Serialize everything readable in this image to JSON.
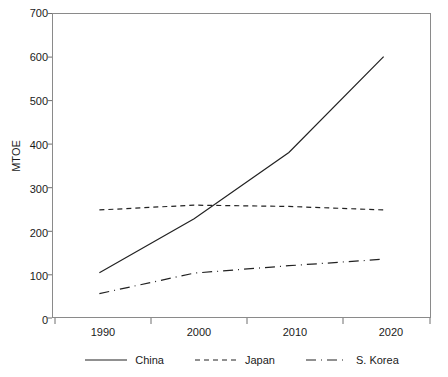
{
  "chart_data": {
    "type": "line",
    "title": "",
    "xlabel": "",
    "ylabel": "MTOE",
    "x": [
      1990,
      2000,
      2010,
      2020
    ],
    "categories": [
      "1990",
      "2000",
      "2010",
      "2020"
    ],
    "xlim": [
      1985,
      2025
    ],
    "ylim": [
      0,
      700
    ],
    "ytick_labels": [
      "0",
      "100",
      "200",
      "300",
      "400",
      "500",
      "600",
      "700"
    ],
    "ytick_values": [
      0,
      100,
      200,
      300,
      400,
      500,
      600,
      700
    ],
    "xtick_labels": [
      "1990",
      "2000",
      "2010",
      "2020"
    ],
    "grid": false,
    "legend_position": "bottom",
    "series": [
      {
        "name": "China",
        "style": "solid",
        "color": "#222222",
        "values": [
          104,
          228,
          380,
          600
        ]
      },
      {
        "name": "Japan",
        "style": "dotted",
        "color": "#222222",
        "values": [
          248,
          259,
          256,
          248
        ]
      },
      {
        "name": "S. Korea",
        "style": "dashed",
        "color": "#222222",
        "values": [
          56,
          103,
          120,
          135
        ]
      }
    ]
  },
  "axis": {
    "y_title": "MTOE",
    "y_ticks": [
      "700",
      "600",
      "500",
      "400",
      "300",
      "200",
      "100",
      "0"
    ],
    "x_ticks": [
      "1990",
      "2000",
      "2010",
      "2020"
    ]
  },
  "legend": {
    "items": [
      {
        "label": "China",
        "key": "solid-line-key"
      },
      {
        "label": "Japan",
        "key": "dotted-line-key"
      },
      {
        "label": "S. Korea",
        "key": "dashed-line-key"
      }
    ]
  }
}
